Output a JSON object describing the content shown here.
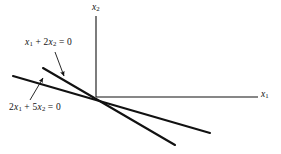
{
  "figure": {
    "kind": "line-diagram",
    "background_color": "#ffffff",
    "ink_color": "#111111",
    "width": 281,
    "height": 154
  },
  "axes": {
    "x_axis": {
      "label_var": "x",
      "label_sub": "1",
      "origin": [
        96,
        97
      ],
      "end": [
        258,
        97
      ]
    },
    "y_axis": {
      "label_var": "x",
      "label_sub": "2",
      "origin": [
        96,
        97
      ],
      "end": [
        96,
        16
      ]
    }
  },
  "lines": [
    {
      "name": "line-x1-plus-2x2",
      "equation_parts": {
        "c1": "",
        "v1": "x",
        "s1": "1",
        "op": "+",
        "c2": "2",
        "v2": "x",
        "s2": "2",
        "rel": "=",
        "rhs": "0"
      },
      "equation_text": "x1 + 2x2 = 0",
      "slope": -0.5,
      "from": [
        43,
        68
      ],
      "to": [
        175,
        145
      ]
    },
    {
      "name": "line-2x1-plus-5x2",
      "equation_parts": {
        "c1": "2",
        "v1": "x",
        "s1": "1",
        "op": "+",
        "c2": "5",
        "v2": "x",
        "s2": "2",
        "rel": "=",
        "rhs": "0"
      },
      "equation_text": "2x1 + 5x2 = 0",
      "slope": -0.4,
      "from": [
        13,
        76
      ],
      "to": [
        210,
        133
      ]
    }
  ],
  "annotations": [
    {
      "name": "pointer-to-line-x1-plus-2x2",
      "from": [
        55,
        52
      ],
      "to": [
        64,
        76
      ]
    },
    {
      "name": "pointer-to-line-2x1-plus-5x2",
      "from": [
        30,
        100
      ],
      "to": [
        43,
        78
      ]
    }
  ]
}
